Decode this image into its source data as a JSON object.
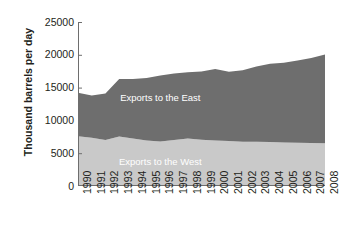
{
  "chart_data": {
    "type": "area",
    "stacked": true,
    "title": "",
    "xlabel": "",
    "ylabel": "Thousand barrels per day",
    "ylim": [
      0,
      25000
    ],
    "yticks": [
      0,
      5000,
      10000,
      15000,
      20000,
      25000
    ],
    "ytick_labels": [
      "0",
      "5000",
      "10000",
      "15000",
      "20000",
      "25000"
    ],
    "grid": false,
    "legend_position": "inline-annotations",
    "categories": [
      "1990",
      "1991",
      "1992",
      "1993",
      "1994",
      "1995",
      "1996",
      "1997",
      "1998",
      "1999",
      "2000",
      "2001",
      "2002",
      "2003",
      "2004",
      "2005",
      "2006",
      "2007",
      "2008"
    ],
    "series": [
      {
        "name": "Exports to the West",
        "color": "#c9c9c9",
        "values": [
          7600,
          7350,
          7000,
          7550,
          7250,
          6950,
          6800,
          7000,
          7250,
          7050,
          6950,
          6850,
          6750,
          6750,
          6700,
          6650,
          6600,
          6550,
          6500
        ]
      },
      {
        "name": "Exports to the East",
        "color": "#6e6e6e",
        "values": [
          6600,
          6450,
          7100,
          8750,
          9050,
          9500,
          10050,
          10150,
          10100,
          10400,
          10900,
          10550,
          10900,
          11450,
          11950,
          12150,
          12550,
          12950,
          13550
        ]
      }
    ],
    "totals": [
      14200,
      13800,
      14100,
      16300,
      16300,
      16450,
      16850,
      17150,
      17350,
      17450,
      17850,
      17400,
      17650,
      18200,
      18650,
      18800,
      19150,
      19500,
      20050
    ],
    "annotations": [
      {
        "text": "Exports to the East",
        "x_index": 6,
        "y_value": 13000,
        "color": "#ffffff"
      },
      {
        "text": "Exports to the West",
        "x_index": 6,
        "y_value": 3200,
        "color": "#ffffff"
      }
    ]
  },
  "axis": {
    "y_title": "Thousand barrels per day"
  }
}
